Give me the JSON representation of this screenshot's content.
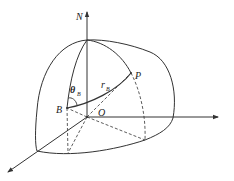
{
  "diagram": {
    "type": "geometric-3d-hemisphere",
    "labels": {
      "north": "N",
      "point_p": "P",
      "point_b": "B",
      "origin": "O",
      "angle": "θ",
      "angle_sub": "B",
      "radius": "r",
      "radius_sub": "B"
    },
    "colors": {
      "stroke": "#333333",
      "background": "#ffffff"
    }
  }
}
